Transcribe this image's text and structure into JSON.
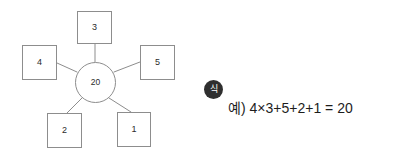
{
  "colors": {
    "background": "#ffffff",
    "stroke": "#8d8d8d",
    "text": "#2b2b2b",
    "badge_fill": "#2f2f2f",
    "badge_text": "#ffffff",
    "equation_text": "#1d1d1d"
  },
  "diagram": {
    "type": "radial-number-web",
    "center": {
      "value": "20"
    },
    "nodes": [
      {
        "position": "top",
        "value": "3"
      },
      {
        "position": "left",
        "value": "4"
      },
      {
        "position": "right",
        "value": "5"
      },
      {
        "position": "bottom-left",
        "value": "2"
      },
      {
        "position": "bottom-right",
        "value": "1"
      }
    ]
  },
  "answer": {
    "badge_label": "식",
    "equation": "예) 4×3+5+2+1 = 20"
  }
}
